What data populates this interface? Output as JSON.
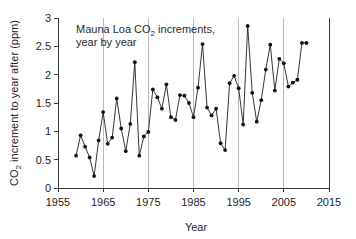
{
  "chart_data": {
    "type": "line",
    "title": "",
    "annotation_line1": "Mauna Loa CO₂ increments,",
    "annotation_line2": "year by year",
    "annotation_prefix": "Mauna Loa CO",
    "annotation_subscript": "2",
    "annotation_suffix": " increments,",
    "xlabel": "Year",
    "ylabel_prefix": "CO",
    "ylabel_subscript": "2",
    "ylabel_suffix": " increment to year after (ppm)",
    "ylabel": "CO₂ increment to year after (ppm)",
    "xlim": [
      1955,
      2015
    ],
    "ylim": [
      0,
      3
    ],
    "xticks": [
      1955,
      1965,
      1975,
      1985,
      1995,
      2005,
      2015
    ],
    "xtick_labels": [
      "1955",
      "1965",
      "1975",
      "1985",
      "1995",
      "2005",
      "2015"
    ],
    "yticks": [
      0,
      0.5,
      1,
      1.5,
      2,
      2.5,
      3
    ],
    "ytick_labels": [
      "0",
      "0.5",
      "1",
      "1.5",
      "2",
      "2.5",
      "3"
    ],
    "gridlines_x": [
      1965,
      1975,
      1985,
      1995,
      2005
    ],
    "grid": "vertical-only",
    "legend": "none",
    "marker": "filled-circle",
    "line_color": "#1f1f1f",
    "marker_color": "#111111",
    "grid_color": "#b9b9b9",
    "axis_color": "#3a3a3a",
    "x": [
      1959,
      1960,
      1961,
      1962,
      1963,
      1964,
      1965,
      1966,
      1967,
      1968,
      1969,
      1970,
      1971,
      1972,
      1973,
      1974,
      1975,
      1976,
      1977,
      1978,
      1979,
      1980,
      1981,
      1982,
      1983,
      1984,
      1985,
      1986,
      1987,
      1988,
      1989,
      1990,
      1991,
      1992,
      1993,
      1994,
      1995,
      1996,
      1997,
      1998,
      1999,
      2000,
      2001,
      2002,
      2003,
      2004,
      2005,
      2006,
      2007,
      2008,
      2009,
      2010
    ],
    "values": [
      0.57,
      0.93,
      0.73,
      0.54,
      0.21,
      0.84,
      1.34,
      0.78,
      0.89,
      1.58,
      1.05,
      0.65,
      1.13,
      2.22,
      0.57,
      0.91,
      0.99,
      1.74,
      1.6,
      1.4,
      1.83,
      1.25,
      1.2,
      1.64,
      1.63,
      1.5,
      1.25,
      1.77,
      2.54,
      1.42,
      1.28,
      1.4,
      0.79,
      0.67,
      1.85,
      1.98,
      1.76,
      1.12,
      2.86,
      1.68,
      1.17,
      1.55,
      2.09,
      2.53,
      1.72,
      2.28,
      2.2,
      1.79,
      1.86,
      1.91,
      2.56,
      2.56
    ],
    "series_name": "Mauna Loa annual CO2 increment"
  },
  "figure": {
    "plot_left": 58,
    "plot_right": 329,
    "plot_top": 18,
    "plot_bottom": 188
  }
}
